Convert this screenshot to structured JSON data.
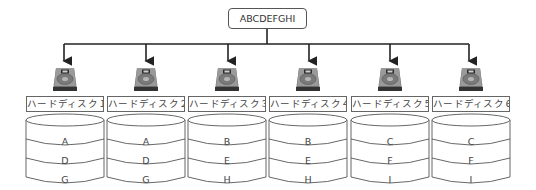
{
  "root": {
    "label": "ABCDEFGHI"
  },
  "colors": {
    "line": "#222222",
    "box_border": "#666666",
    "text": "#444444",
    "hdd_dark": "#333333",
    "hdd_mid": "#8a8a8a"
  },
  "disks": [
    {
      "label": "ハードディスク１",
      "blocks": [
        "A",
        "D",
        "G"
      ],
      "icon": "hard-disk-icon"
    },
    {
      "label": "ハードディスク２",
      "blocks": [
        "A",
        "D",
        "G"
      ],
      "icon": "hard-disk-icon"
    },
    {
      "label": "ハードディスク３",
      "blocks": [
        "B",
        "E",
        "H"
      ],
      "icon": "hard-disk-icon"
    },
    {
      "label": "ハードディスク４",
      "blocks": [
        "B",
        "E",
        "H"
      ],
      "icon": "hard-disk-icon"
    },
    {
      "label": "ハードディスク５",
      "blocks": [
        "C",
        "F",
        "I"
      ],
      "icon": "hard-disk-icon"
    },
    {
      "label": "ハードディスク６",
      "blocks": [
        "C",
        "F",
        "I"
      ],
      "icon": "hard-disk-icon"
    }
  ]
}
